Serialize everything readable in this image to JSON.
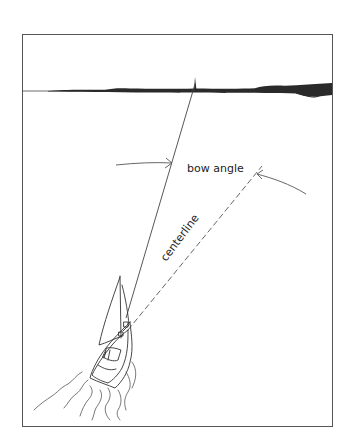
{
  "figure": {
    "type": "illustration",
    "frame": {
      "x": 22,
      "y": 34,
      "width": 310,
      "height": 392,
      "stroke": "#555555"
    },
    "colors": {
      "ink": "#333333",
      "shore": "#2a2a2a",
      "background": "#ffffff"
    }
  },
  "labels": {
    "bow_angle": "bow angle",
    "centerline": "centerline"
  },
  "elements": {
    "horizon": {
      "y": 91
    },
    "heading_line": {
      "from": [
        126,
        318
      ],
      "to": [
        195,
        80
      ],
      "style": "solid"
    },
    "centerline_line": {
      "from": [
        128,
        330
      ],
      "to": [
        262,
        166
      ],
      "style": "dashed"
    },
    "bow_angle_arrows": [
      {
        "name": "left-arrow",
        "from": [
          116,
          163
        ],
        "to": [
          172,
          162
        ]
      },
      {
        "name": "right-arrow",
        "from": [
          306,
          194
        ],
        "to": [
          256,
          174
        ]
      }
    ]
  }
}
